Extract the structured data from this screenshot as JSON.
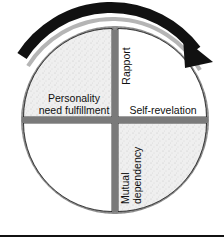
{
  "diagram": {
    "type": "quadrant-cycle",
    "direction_arrow": "clockwise",
    "quadrants": [
      {
        "position": "top-left",
        "label": "Personality need fulfillment",
        "line1": "Personality",
        "line2": "need fulfillment",
        "fill": "speckled-gray"
      },
      {
        "position": "top-right",
        "label_rotated": "Rapport",
        "label": "Self-revelation",
        "fill": "white"
      },
      {
        "position": "bottom-left",
        "label": "",
        "fill": "white"
      },
      {
        "position": "bottom-right",
        "label_rotated_line1": "Mutual",
        "label_rotated_line2": "dependency",
        "fill": "speckled-gray"
      }
    ],
    "colors": {
      "arrow": "#111111",
      "ring": "#8a8a8a",
      "speckle_fill": "#eeeeee",
      "divider": "#7a7a7a",
      "text": "#111111"
    }
  }
}
